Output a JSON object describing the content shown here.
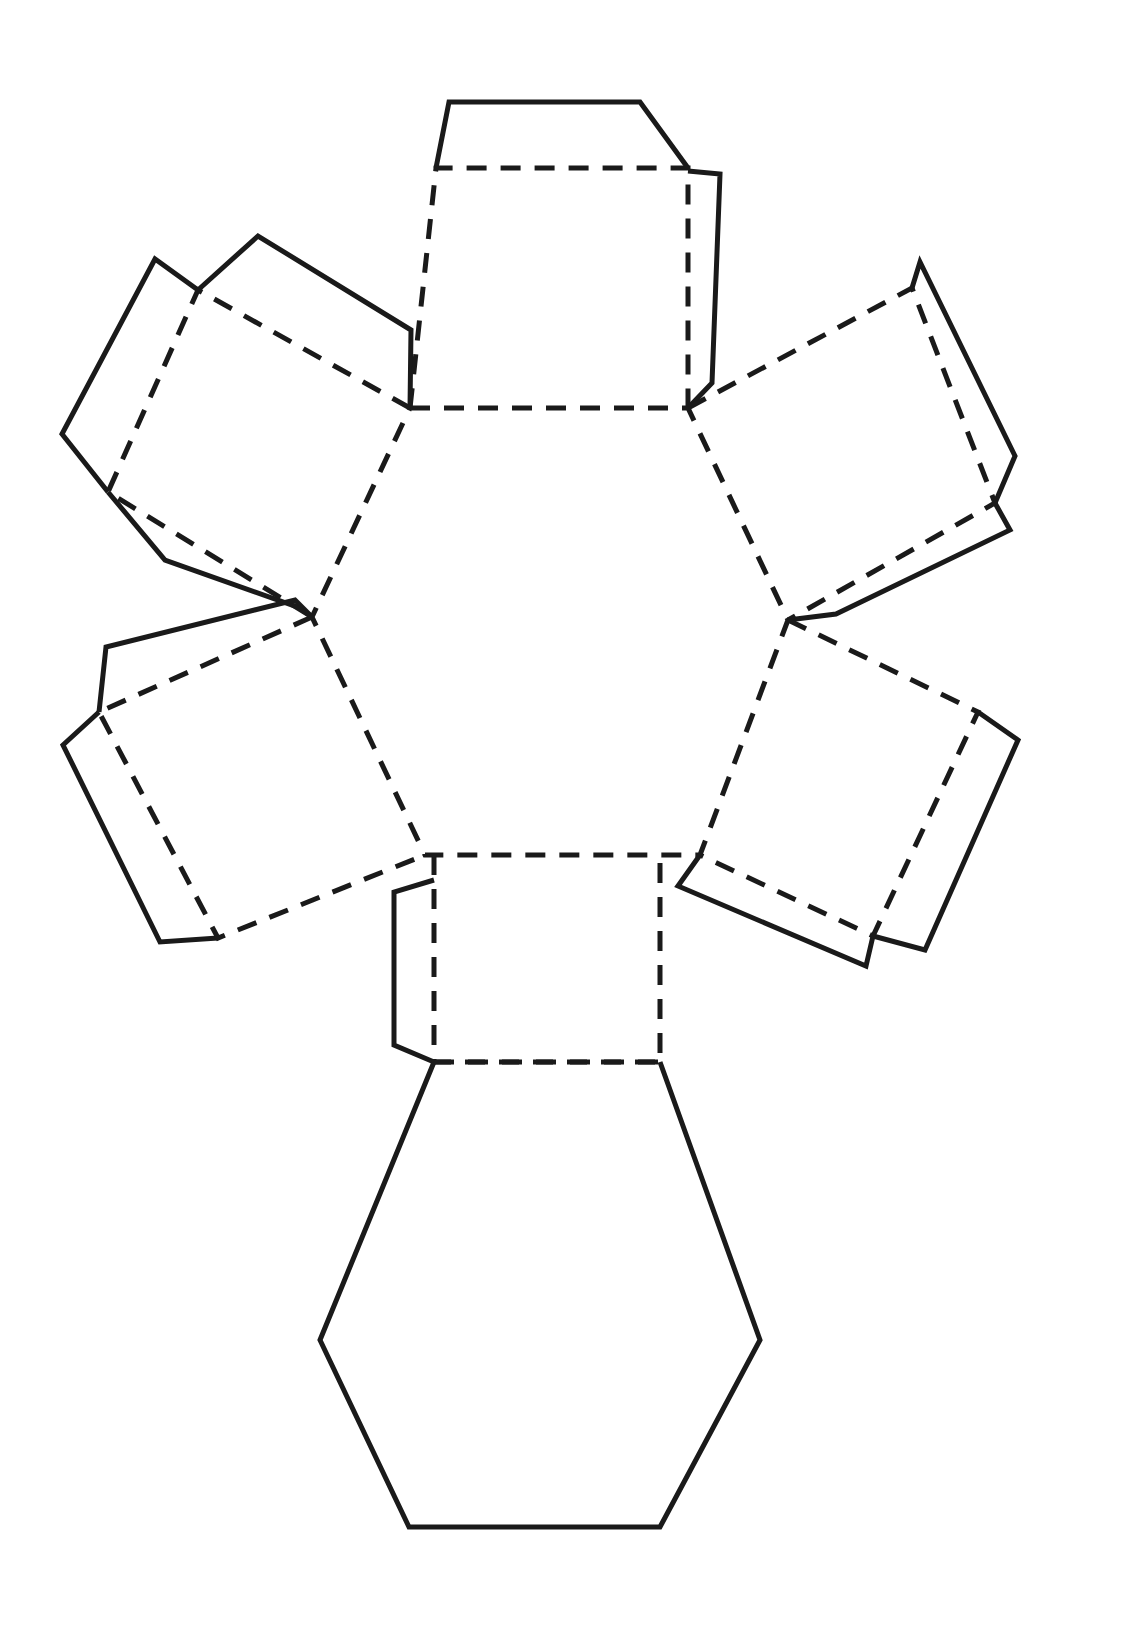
{
  "document": {
    "title": "Hexagonal Prism Net",
    "page_size": {
      "width": 1135,
      "height": 1652
    },
    "background_color": "#ffffff",
    "line_color": "#1a1a1a",
    "line_width": 5,
    "fold_dash_pattern": "20 14"
  },
  "legend": {
    "fold_line_style": "dashed",
    "cut_line_style": "solid"
  },
  "net": {
    "solid_name": "hexagonal prism",
    "face_count": 8,
    "faces": [
      {
        "id": "center-hexagon",
        "name": "top-hexagon-face",
        "shape": "hexagon",
        "line_style": "dashed",
        "points": "410,408 688,408 788,620 700,855 425,855 312,617"
      },
      {
        "id": "bottom-hexagon",
        "name": "bottom-hexagon-face",
        "shape": "hexagon",
        "line_style": "solid",
        "points": "434,1062 660,1062 760,1340 660,1527 409,1527 320,1340",
        "fold_edge": "434,1062 660,1062"
      },
      {
        "id": "square-top",
        "name": "rectangular-side-face-top",
        "shape": "square",
        "line_style": "dashed",
        "points": "436,168 688,168 688,408 410,408"
      },
      {
        "id": "square-upper-left",
        "name": "rectangular-side-face-upper-left",
        "shape": "square",
        "line_style": "dashed",
        "points": "198,290 410,408 312,617 108,492"
      },
      {
        "id": "square-upper-right",
        "name": "rectangular-side-face-upper-right",
        "shape": "square",
        "line_style": "dashed",
        "points": "688,408 912,288 995,503 788,620"
      },
      {
        "id": "square-lower-left",
        "name": "rectangular-side-face-lower-left",
        "shape": "square",
        "line_style": "dashed",
        "points": "312,617 425,855 218,938 99,712"
      },
      {
        "id": "square-lower-right",
        "name": "rectangular-side-face-lower-right",
        "shape": "square",
        "line_style": "dashed",
        "points": "788,620 978,712 873,936 700,855"
      },
      {
        "id": "square-bottom",
        "name": "rectangular-side-face-bottom",
        "shape": "square",
        "line_style": "dashed",
        "points": "434,855 660,855 660,1062 434,1062"
      }
    ],
    "tabs": [
      {
        "id": "tab-top-top",
        "name": "glue-tab-top-of-top-square",
        "line_style": "solid",
        "points": "436,168 449,102 640,102 688,168"
      },
      {
        "id": "tab-top-right",
        "name": "glue-tab-right-of-top-square",
        "line_style": "solid",
        "points": "688,171 720,174 712,383 688,408"
      },
      {
        "id": "tab-ul-a",
        "name": "glue-tab-upper-left-outer",
        "line_style": "solid",
        "points": "198,290 155,259 62,434 108,492"
      },
      {
        "id": "tab-ul-b",
        "name": "glue-tab-upper-left-top",
        "line_style": "solid",
        "points": "198,290 258,236 411,330 410,408"
      },
      {
        "id": "tab-ul-c",
        "name": "glue-tab-upper-left-bottom",
        "line_style": "solid",
        "points": "108,492 165,560 300,608 312,617"
      },
      {
        "id": "tab-ur-a",
        "name": "glue-tab-upper-right-top",
        "line_style": "solid",
        "points": "912,288 920,262 1015,456 995,503"
      },
      {
        "id": "tab-ur-b",
        "name": "glue-tab-upper-right-outer",
        "line_style": "solid",
        "points": "995,503 1010,530 836,614 788,620"
      },
      {
        "id": "tab-ll-a",
        "name": "glue-tab-lower-left-outer",
        "line_style": "solid",
        "points": "99,712 63,745 160,942 218,938"
      },
      {
        "id": "tab-ll-b",
        "name": "glue-tab-lower-left-top",
        "line_style": "solid",
        "points": "99,712 106,647 295,600 312,617"
      },
      {
        "id": "tab-lr-a",
        "name": "glue-tab-lower-right-outer",
        "line_style": "solid",
        "points": "978,712 1018,740 925,950 873,936"
      },
      {
        "id": "tab-lr-b",
        "name": "glue-tab-lower-right-bottom",
        "line_style": "solid",
        "points": "873,936 866,966 678,886 700,855"
      },
      {
        "id": "tab-bottom-left",
        "name": "glue-tab-left-of-bottom-square",
        "line_style": "solid",
        "points": "434,880 394,892 394,1045 434,1062"
      }
    ]
  }
}
